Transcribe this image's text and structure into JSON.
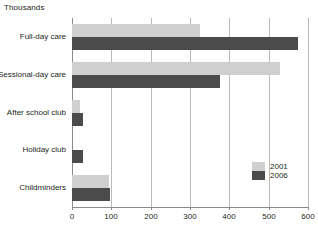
{
  "chart_data": {
    "type": "bar",
    "orientation": "horizontal",
    "title": "Thousands",
    "xlabel": "",
    "ylabel": "",
    "xlim": [
      0,
      600
    ],
    "xticks": [
      0,
      100,
      200,
      300,
      400,
      500,
      600
    ],
    "xtick_labels": [
      "0",
      "100",
      "200",
      "300",
      "400",
      "500",
      "600"
    ],
    "grid": true,
    "grid_axis": "x",
    "legend_position": "lower-right",
    "categories": [
      "Full-day care",
      "Sessional-day care",
      "After school club",
      "Holiday club",
      "Childminders"
    ],
    "series": [
      {
        "name": "2001",
        "color": "#cfcfcf",
        "values": [
          325,
          530,
          20,
          0,
          95
        ]
      },
      {
        "name": "2006",
        "color": "#4b4b4b",
        "values": [
          575,
          375,
          28,
          28,
          97
        ]
      }
    ]
  },
  "legend": {
    "items": [
      {
        "label": "2001",
        "color": "#cfcfcf"
      },
      {
        "label": "2006",
        "color": "#4b4b4b"
      }
    ]
  },
  "axis": {
    "tick_labels": [
      "0",
      "100",
      "200",
      "300",
      "400",
      "500",
      "600"
    ]
  },
  "colors": {
    "series_2001": "#cfcfcf",
    "series_2006": "#4b4b4b",
    "gridline": "#b9b9b9",
    "axis": "#8a8a8a",
    "text": "#231f20",
    "background": "#ffffff"
  }
}
